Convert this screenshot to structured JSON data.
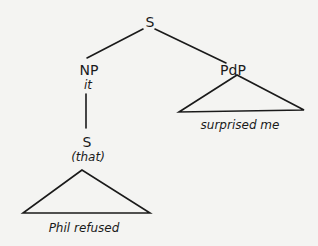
{
  "diagram": {
    "type": "syntax-tree",
    "nodes": {
      "root": {
        "label": "S"
      },
      "np": {
        "label": "NP",
        "word": "it"
      },
      "pdp": {
        "label": "PdP",
        "triangle_text": "surprised me"
      },
      "embedded_s": {
        "label": "S",
        "word": "(that)",
        "triangle_text": "Phil refused"
      }
    },
    "edges": [
      [
        "root",
        "np"
      ],
      [
        "root",
        "pdp"
      ],
      [
        "np",
        "embedded_s"
      ]
    ],
    "colors": {
      "ink": "#1a1a1a",
      "paper": "#f4f4f2"
    }
  }
}
